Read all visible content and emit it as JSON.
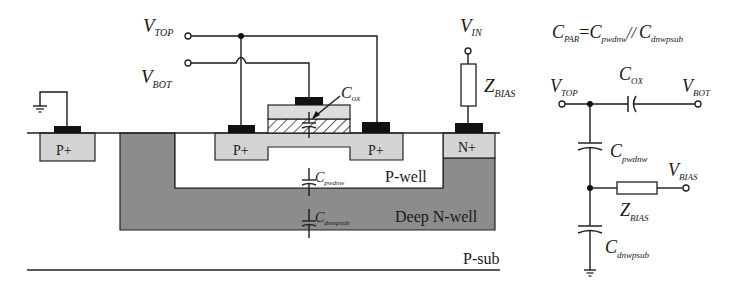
{
  "cross_section": {
    "terminals": {
      "v_top": {
        "main": "V",
        "sub": "TOP"
      },
      "v_bot": {
        "main": "V",
        "sub": "BOT"
      },
      "v_in": {
        "main": "V",
        "sub": "IN"
      },
      "z_bias": {
        "main": "Z",
        "sub": "BIAS"
      }
    },
    "regions": {
      "p_plus_left": "P+",
      "p_plus_source": "P+",
      "p_plus_drain": "P+",
      "n_plus": "N+",
      "p_well": "P-well",
      "deep_n_well": "Deep N-well",
      "p_sub": "P-sub"
    },
    "capacitors": {
      "c_ox": {
        "main": "C",
        "sub": "ox"
      },
      "c_pwdnw": {
        "main": "C",
        "sub": "pwdnw"
      },
      "c_dnwpsub": {
        "main": "C",
        "sub": "dnwpsub"
      }
    },
    "colors": {
      "diffusion": "#d4d4d4",
      "deep_n_well": "#8c8c8c",
      "contact": "#111111",
      "poly": "#dcdcdc"
    }
  },
  "equivalent_circuit": {
    "equation": {
      "lhs_main": "C",
      "lhs_sub": "PAR",
      "eq": "=",
      "t1_main": "C",
      "t1_sub": "pwdnw",
      "par": "//",
      "t2_main": "C",
      "t2_sub": "dnwpsub"
    },
    "nodes": {
      "v_top": {
        "main": "V",
        "sub": "TOP"
      },
      "v_bot": {
        "main": "V",
        "sub": "BOT"
      },
      "v_bias": {
        "main": "V",
        "sub": "BIAS"
      }
    },
    "components": {
      "c_ox": {
        "main": "C",
        "sub": "OX"
      },
      "c_pwdnw": {
        "main": "C",
        "sub": "pwdnw"
      },
      "z_bias": {
        "main": "Z",
        "sub": "BIAS"
      },
      "c_dnwpsub": {
        "main": "C",
        "sub": "dnwpsub"
      }
    }
  }
}
